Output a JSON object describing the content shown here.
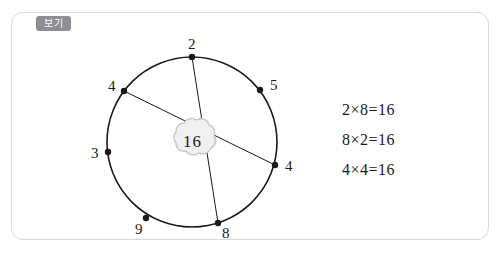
{
  "panel": {
    "tag_label": "보기"
  },
  "diagram": {
    "center_label": "16",
    "nodes": [
      {
        "label": "2",
        "pos": "top"
      },
      {
        "label": "5",
        "pos": "upper-right"
      },
      {
        "label": "4",
        "pos": "right"
      },
      {
        "label": "8",
        "pos": "lower-right"
      },
      {
        "label": "9",
        "pos": "lower-left"
      },
      {
        "label": "3",
        "pos": "left"
      },
      {
        "label": "4",
        "pos": "upper-left"
      }
    ],
    "chords": [
      {
        "from": "2",
        "to": "8"
      },
      {
        "from": "4-upper-left",
        "to": "4-right"
      }
    ]
  },
  "equations": [
    "2×8=16",
    "8×2=16",
    "4×4=16"
  ],
  "colors": {
    "tag_bg": "#8e8e93",
    "panel_border": "#d8d8d8",
    "stroke": "#1a1a1a",
    "cloud_fill": "#f0f0f0",
    "cloud_border": "#c8c8c8"
  }
}
